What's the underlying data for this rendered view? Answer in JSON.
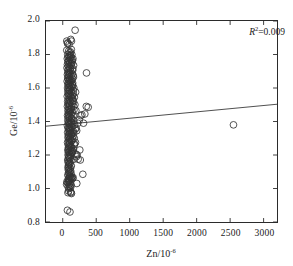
{
  "chart_data": {
    "type": "scatter",
    "title": "",
    "xlabel": "Zn/10-6",
    "ylabel": "Ge/10-6",
    "xlabel_base": "Zn/10",
    "xlabel_exp": "-6",
    "ylabel_base": "Ge/10",
    "ylabel_exp": "-6",
    "xlim": [
      -250,
      3200
    ],
    "ylim": [
      0.8,
      2.0
    ],
    "xticks": [
      0,
      500,
      1000,
      1500,
      2000,
      2500,
      3000
    ],
    "xtick_labels": [
      "0",
      "500",
      "1000",
      "1500",
      "2000",
      "2500",
      "3000"
    ],
    "yticks": [
      0.8,
      1.0,
      1.2,
      1.4,
      1.6,
      1.8,
      2.0
    ],
    "ytick_labels": [
      "0.8",
      "1.0",
      "1.2",
      "1.4",
      "1.6",
      "1.8",
      "2.0"
    ],
    "grid": false,
    "legend": null,
    "marker": "open-circle",
    "marker_size": 3.4,
    "marker_color": "#333333",
    "line_color": "#3a3a3a",
    "annotations": [
      {
        "text": "R2=0.009",
        "symbol": "R",
        "exponent": "2",
        "value": "=0.009",
        "position": "top-right"
      }
    ],
    "trendline": {
      "x_start": -250,
      "y_start": 1.372,
      "x_end": 3200,
      "y_end": 1.503,
      "slope": 3.8e-05,
      "intercept": 1.3815,
      "r_squared": 0.009
    },
    "points": [
      [
        60,
        1.88
      ],
      [
        75,
        1.87
      ],
      [
        120,
        1.89
      ],
      [
        130,
        1.88
      ],
      [
        95,
        1.86
      ],
      [
        72,
        1.865
      ],
      [
        185,
        1.945
      ],
      [
        60,
        1.825
      ],
      [
        88,
        1.82
      ],
      [
        102,
        1.81
      ],
      [
        75,
        1.8
      ],
      [
        115,
        1.795
      ],
      [
        95,
        1.79
      ],
      [
        80,
        1.785
      ],
      [
        105,
        1.78
      ],
      [
        68,
        1.775
      ],
      [
        120,
        1.77
      ],
      [
        88,
        1.765
      ],
      [
        98,
        1.76
      ],
      [
        78,
        1.755
      ],
      [
        110,
        1.75
      ],
      [
        92,
        1.745
      ],
      [
        70,
        1.74
      ],
      [
        125,
        1.735
      ],
      [
        84,
        1.73
      ],
      [
        100,
        1.725
      ],
      [
        64,
        1.72
      ],
      [
        112,
        1.715
      ],
      [
        90,
        1.71
      ],
      [
        76,
        1.705
      ],
      [
        118,
        1.7
      ],
      [
        96,
        1.695
      ],
      [
        80,
        1.69
      ],
      [
        106,
        1.685
      ],
      [
        70,
        1.68
      ],
      [
        355,
        1.69
      ],
      [
        88,
        1.675
      ],
      [
        124,
        1.67
      ],
      [
        94,
        1.665
      ],
      [
        74,
        1.66
      ],
      [
        108,
        1.655
      ],
      [
        86,
        1.65
      ],
      [
        140,
        1.62
      ],
      [
        98,
        1.645
      ],
      [
        66,
        1.64
      ],
      [
        116,
        1.635
      ],
      [
        92,
        1.63
      ],
      [
        78,
        1.625
      ],
      [
        104,
        1.62
      ],
      [
        84,
        1.615
      ],
      [
        120,
        1.61
      ],
      [
        96,
        1.605
      ],
      [
        72,
        1.6
      ],
      [
        110,
        1.595
      ],
      [
        88,
        1.59
      ],
      [
        100,
        1.585
      ],
      [
        76,
        1.58
      ],
      [
        128,
        1.575
      ],
      [
        94,
        1.57
      ],
      [
        82,
        1.565
      ],
      [
        114,
        1.56
      ],
      [
        90,
        1.555
      ],
      [
        68,
        1.55
      ],
      [
        122,
        1.545
      ],
      [
        98,
        1.54
      ],
      [
        150,
        1.535
      ],
      [
        86,
        1.53
      ],
      [
        106,
        1.525
      ],
      [
        74,
        1.52
      ],
      [
        118,
        1.515
      ],
      [
        92,
        1.51
      ],
      [
        80,
        1.505
      ],
      [
        102,
        1.5
      ],
      [
        96,
        1.495
      ],
      [
        70,
        1.49
      ],
      [
        130,
        1.485
      ],
      [
        88,
        1.48
      ],
      [
        380,
        1.485
      ],
      [
        110,
        1.475
      ],
      [
        94,
        1.47
      ],
      [
        78,
        1.465
      ],
      [
        116,
        1.46
      ],
      [
        100,
        1.455
      ],
      [
        84,
        1.45
      ],
      [
        124,
        1.445
      ],
      [
        90,
        1.44
      ],
      [
        72,
        1.435
      ],
      [
        108,
        1.43
      ],
      [
        96,
        1.425
      ],
      [
        82,
        1.42
      ],
      [
        134,
        1.415
      ],
      [
        102,
        1.41
      ],
      [
        76,
        1.405
      ],
      [
        120,
        1.4
      ],
      [
        92,
        1.395
      ],
      [
        86,
        1.39
      ],
      [
        112,
        1.385
      ],
      [
        98,
        1.38
      ],
      [
        70,
        1.375
      ],
      [
        128,
        1.37
      ],
      [
        94,
        1.365
      ],
      [
        80,
        1.36
      ],
      [
        106,
        1.355
      ],
      [
        90,
        1.35
      ],
      [
        118,
        1.345
      ],
      [
        100,
        1.34
      ],
      [
        74,
        1.335
      ],
      [
        140,
        1.335
      ],
      [
        110,
        1.33
      ],
      [
        96,
        1.325
      ],
      [
        84,
        1.32
      ],
      [
        124,
        1.315
      ],
      [
        92,
        1.31
      ],
      [
        78,
        1.305
      ],
      [
        114,
        1.3
      ],
      [
        102,
        1.295
      ],
      [
        88,
        1.29
      ],
      [
        130,
        1.285
      ],
      [
        98,
        1.28
      ],
      [
        72,
        1.275
      ],
      [
        108,
        1.27
      ],
      [
        94,
        1.265
      ],
      [
        82,
        1.26
      ],
      [
        120,
        1.255
      ],
      [
        100,
        1.25
      ],
      [
        86,
        1.245
      ],
      [
        126,
        1.24
      ],
      [
        90,
        1.235
      ],
      [
        76,
        1.23
      ],
      [
        112,
        1.225
      ],
      [
        96,
        1.22
      ],
      [
        84,
        1.215
      ],
      [
        134,
        1.21
      ],
      [
        104,
        1.205
      ],
      [
        80,
        1.2
      ],
      [
        118,
        1.195
      ],
      [
        92,
        1.19
      ],
      [
        88,
        1.185
      ],
      [
        108,
        1.18
      ],
      [
        98,
        1.175
      ],
      [
        74,
        1.17
      ],
      [
        122,
        1.165
      ],
      [
        94,
        1.16
      ],
      [
        82,
        1.155
      ],
      [
        110,
        1.15
      ],
      [
        100,
        1.145
      ],
      [
        86,
        1.14
      ],
      [
        128,
        1.135
      ],
      [
        90,
        1.13
      ],
      [
        78,
        1.125
      ],
      [
        114,
        1.12
      ],
      [
        96,
        1.115
      ],
      [
        84,
        1.11
      ],
      [
        118,
        1.105
      ],
      [
        102,
        1.1
      ],
      [
        88,
        1.095
      ],
      [
        124,
        1.09
      ],
      [
        94,
        1.085
      ],
      [
        76,
        1.08
      ],
      [
        106,
        1.075
      ],
      [
        98,
        1.07
      ],
      [
        112,
        1.065
      ],
      [
        90,
        1.06
      ],
      [
        82,
        1.055
      ],
      [
        120,
        1.06
      ],
      [
        130,
        1.065
      ],
      [
        100,
        1.05
      ],
      [
        86,
        1.045
      ],
      [
        96,
        1.04
      ],
      [
        72,
        1.035
      ],
      [
        110,
        1.03
      ],
      [
        92,
        1.025
      ],
      [
        62,
        1.04
      ],
      [
        58,
        1.025
      ],
      [
        126,
        1.02
      ],
      [
        104,
        1.015
      ],
      [
        80,
        1.01
      ],
      [
        116,
        1.005
      ],
      [
        94,
        1.0
      ],
      [
        88,
        0.985
      ],
      [
        124,
        0.975
      ],
      [
        130,
        0.97
      ],
      [
        78,
        0.975
      ],
      [
        118,
        0.98
      ],
      [
        70,
        0.87
      ],
      [
        108,
        0.86
      ],
      [
        210,
        1.03
      ],
      [
        230,
        1.175
      ],
      [
        255,
        1.23
      ],
      [
        300,
        1.085
      ],
      [
        262,
        1.17
      ],
      [
        205,
        1.19
      ],
      [
        215,
        1.2
      ],
      [
        198,
        1.205
      ],
      [
        178,
        1.265
      ],
      [
        190,
        1.275
      ],
      [
        172,
        1.3
      ],
      [
        164,
        1.33
      ],
      [
        208,
        1.345
      ],
      [
        186,
        1.355
      ],
      [
        200,
        1.36
      ],
      [
        176,
        1.38
      ],
      [
        225,
        1.39
      ],
      [
        248,
        1.41
      ],
      [
        268,
        1.435
      ],
      [
        286,
        1.44
      ],
      [
        330,
        1.445
      ],
      [
        352,
        1.49
      ],
      [
        196,
        1.465
      ],
      [
        168,
        1.47
      ],
      [
        182,
        1.5
      ],
      [
        160,
        1.52
      ],
      [
        174,
        1.545
      ],
      [
        158,
        1.565
      ],
      [
        192,
        1.575
      ],
      [
        166,
        1.6
      ],
      [
        150,
        1.615
      ],
      [
        144,
        1.655
      ],
      [
        156,
        1.675
      ],
      [
        148,
        1.705
      ],
      [
        162,
        1.735
      ],
      [
        138,
        1.755
      ],
      [
        152,
        1.775
      ],
      [
        2550,
        1.38
      ],
      [
        310,
        1.39
      ],
      [
        145,
        1.06
      ],
      [
        155,
        1.065
      ],
      [
        138,
        1.07
      ],
      [
        166,
        1.175
      ],
      [
        148,
        1.22
      ],
      [
        136,
        1.215
      ],
      [
        142,
        1.225
      ],
      [
        158,
        1.235
      ],
      [
        128,
        1.245
      ],
      [
        170,
        1.26
      ],
      [
        134,
        1.285
      ],
      [
        146,
        1.295
      ],
      [
        154,
        1.31
      ],
      [
        132,
        1.325
      ],
      [
        160,
        1.34
      ],
      [
        140,
        1.365
      ],
      [
        150,
        1.385
      ],
      [
        126,
        1.395
      ],
      [
        168,
        1.405
      ],
      [
        136,
        1.42
      ],
      [
        156,
        1.435
      ],
      [
        144,
        1.455
      ],
      [
        130,
        1.475
      ],
      [
        164,
        1.49
      ],
      [
        142,
        1.505
      ],
      [
        152,
        1.525
      ],
      [
        134,
        1.54
      ],
      [
        146,
        1.555
      ],
      [
        158,
        1.585
      ],
      [
        138,
        1.605
      ],
      [
        148,
        1.63
      ],
      [
        128,
        1.645
      ],
      [
        160,
        1.665
      ],
      [
        140,
        1.685
      ],
      [
        150,
        1.715
      ],
      [
        132,
        1.745
      ],
      [
        144,
        1.765
      ],
      [
        124,
        1.785
      ],
      [
        136,
        1.8
      ],
      [
        116,
        1.815
      ],
      [
        128,
        1.83
      ]
    ]
  }
}
